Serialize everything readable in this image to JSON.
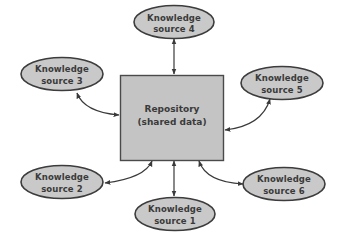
{
  "diagram": {
    "type": "blackboard-architecture",
    "colors": {
      "node_fill": "#c9c9c9",
      "node_stroke": "#3c3c3c",
      "repository_fill": "#c4c4c4",
      "repository_stroke": "#4a4a4a",
      "connector": "#3a3a3a",
      "text": "#3a3a3a",
      "background": "#ffffff"
    },
    "repository": {
      "line1": "Repository",
      "line2": "(shared data)"
    },
    "sources": [
      {
        "id": "ks1",
        "line1": "Knowledge",
        "line2": "source 1"
      },
      {
        "id": "ks2",
        "line1": "Knowledge",
        "line2": "source 2"
      },
      {
        "id": "ks3",
        "line1": "Knowledge",
        "line2": "source 3"
      },
      {
        "id": "ks4",
        "line1": "Knowledge",
        "line2": "source 4"
      },
      {
        "id": "ks5",
        "line1": "Knowledge",
        "line2": "source 5"
      },
      {
        "id": "ks6",
        "line1": "Knowledge",
        "line2": "source 6"
      }
    ],
    "connections": [
      {
        "from": "ks1",
        "to": "repository",
        "direction": "bidirectional"
      },
      {
        "from": "ks2",
        "to": "repository",
        "direction": "bidirectional"
      },
      {
        "from": "ks3",
        "to": "repository",
        "direction": "bidirectional"
      },
      {
        "from": "ks4",
        "to": "repository",
        "direction": "bidirectional"
      },
      {
        "from": "ks5",
        "to": "repository",
        "direction": "bidirectional"
      },
      {
        "from": "ks6",
        "to": "repository",
        "direction": "bidirectional"
      }
    ]
  }
}
